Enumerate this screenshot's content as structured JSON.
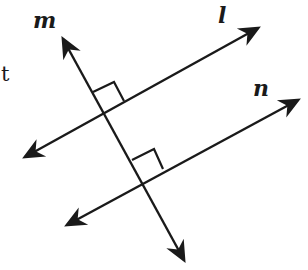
{
  "diagram": {
    "type": "geometry-lines",
    "colors": {
      "stroke": "#1a1a1a",
      "background": "#ffffff"
    },
    "labels": {
      "m": "m",
      "l": "l",
      "n": "n",
      "t": "t"
    },
    "lines": [
      {
        "name": "m",
        "from": [
          186,
          264
        ],
        "to": [
          61,
          35
        ],
        "arrows": "both"
      },
      {
        "name": "l",
        "from": [
          21,
          159
        ],
        "to": [
          262,
          26
        ],
        "arrows": "both"
      },
      {
        "name": "n",
        "from": [
          63,
          227
        ],
        "to": [
          302,
          98
        ],
        "arrows": "both"
      }
    ],
    "right_angles": [
      {
        "at": "m∩l",
        "vertex": [
          104,
          113
        ]
      },
      {
        "at": "m∩n",
        "vertex": [
          143,
          180
        ]
      }
    ]
  }
}
